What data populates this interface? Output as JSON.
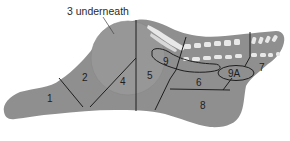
{
  "diagram": {
    "type": "anatomical-muscle-map",
    "callout": "3 underneath",
    "colors": {
      "background": "#ffffff",
      "body_fill": "#8f8f8f",
      "circle_fill": "#979797",
      "bone_fill": "#e6e6e6",
      "outline": "#1e1e1e"
    },
    "regions": [
      {
        "id": "1",
        "label": "1"
      },
      {
        "id": "2",
        "label": "2"
      },
      {
        "id": "3",
        "label": "3",
        "note": "underneath"
      },
      {
        "id": "4",
        "label": "4"
      },
      {
        "id": "5",
        "label": "5"
      },
      {
        "id": "6",
        "label": "6"
      },
      {
        "id": "7",
        "label": "7"
      },
      {
        "id": "8",
        "label": "8"
      },
      {
        "id": "9",
        "label": "9"
      },
      {
        "id": "9A",
        "label": "9A"
      }
    ]
  }
}
